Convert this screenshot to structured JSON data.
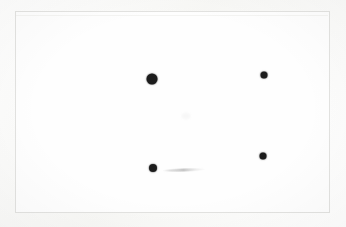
{
  "scene": {
    "title": "Dot pattern on white card",
    "background_color": "#f8f8f6",
    "card_color": "#fefefe",
    "border_color": "#e2e2e0",
    "dot_color": "#1c1c1c"
  },
  "card": {
    "x": 15,
    "y": 11,
    "width": 315,
    "height": 202
  },
  "chart_data": {
    "type": "scatter",
    "title": "",
    "xlabel": "",
    "ylabel": "",
    "xlim": [
      15,
      330
    ],
    "ylim": [
      11,
      213
    ],
    "grid": false,
    "legend": null,
    "marker_color": "#1c1c1c",
    "points": [
      {
        "label": "dot-top-left",
        "x": 151,
        "y": 78,
        "size": 11
      },
      {
        "label": "dot-top-right",
        "x": 263,
        "y": 74,
        "size": 7
      },
      {
        "label": "dot-bottom-left",
        "x": 152,
        "y": 167,
        "size": 8
      },
      {
        "label": "dot-bottom-right",
        "x": 262,
        "y": 155,
        "size": 7
      }
    ]
  },
  "artifacts": [
    {
      "label": "smudge-center",
      "x": 185,
      "y": 115,
      "width": 9,
      "height": 6,
      "opacity": 0.05
    },
    {
      "label": "streak-bottom",
      "x": 183,
      "y": 169,
      "width": 44,
      "height": 3
    }
  ]
}
